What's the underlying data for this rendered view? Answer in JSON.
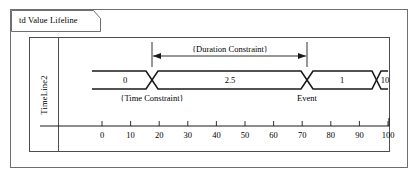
{
  "diagram": {
    "frame_label": "td Value Lifeline",
    "lifeline_name": "TimeLine2",
    "duration_constraint_label": "{Duration Constraint}",
    "time_constraint_label": "{Time Constraint}",
    "event_label": "Event",
    "colors": {
      "line": "#1a1a1a",
      "frame": "#6f6f6f",
      "box": "#4d4d4d",
      "text": "#000000",
      "background": "#ffffff"
    }
  },
  "chart_data": {
    "type": "line",
    "title": "td Value Lifeline",
    "xlabel": "",
    "ylabel": "TimeLine2",
    "xlim": [
      0,
      100
    ],
    "x_ticks": [
      0,
      10,
      20,
      30,
      40,
      50,
      60,
      70,
      80,
      90,
      100
    ],
    "x_tick_labels": [
      "0",
      "10",
      "20",
      "30",
      "40",
      "50",
      "60",
      "70",
      "80",
      "90",
      "100"
    ],
    "grid": false,
    "legend": "none",
    "value_lifeline": {
      "segments": [
        {
          "value": "0",
          "start": 0,
          "end": 20
        },
        {
          "value": "2.5",
          "start": 20,
          "end": 70
        },
        {
          "value": "1",
          "start": 70,
          "end": 90
        },
        {
          "value": "10",
          "start": 90,
          "end": 100
        }
      ],
      "transitions": [
        20,
        70,
        90
      ]
    },
    "annotations": [
      {
        "text": "{Duration Constraint}",
        "type": "duration-arrow",
        "from": 20,
        "to": 70,
        "position": "above"
      },
      {
        "text": "{Time Constraint}",
        "type": "time-constraint",
        "at": 20,
        "position": "below"
      },
      {
        "text": "Event",
        "type": "event",
        "at": 70,
        "position": "below"
      }
    ]
  }
}
